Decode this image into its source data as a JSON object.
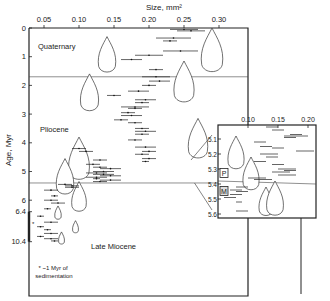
{
  "chart_data": {
    "type": "scatter",
    "title": "",
    "xlabel": "Size, mm²",
    "ylabel": "Age, Myr",
    "x_ticks": [
      "0.05",
      "0.10",
      "0.15",
      "0.20",
      "0.25",
      "0.30"
    ],
    "x_tick_values": [
      0.05,
      0.1,
      0.15,
      0.2,
      0.25,
      0.3
    ],
    "y_ticks": [
      "0",
      "1",
      "2",
      "3",
      "4",
      "5",
      "6",
      "6.4",
      "10.4"
    ],
    "y_tick_values": [
      0,
      1,
      2,
      3,
      4,
      5,
      6,
      6.4,
      10.4
    ],
    "xlim": [
      0.02,
      0.33
    ],
    "ylim": [
      0,
      11.0
    ],
    "epochs": [
      {
        "name": "Quaternary",
        "boundary_myr": 1.7
      },
      {
        "name": "Pliocene",
        "boundary_myr": 5.4
      },
      {
        "name": "Late Miocene",
        "boundary_myr": null
      }
    ],
    "footnote": "* ~1 Myr of sedimentation",
    "series": [
      {
        "name": "size ranges",
        "points": [
          {
            "age": 0.05,
            "x0": 0.23,
            "x1": 0.27
          },
          {
            "age": 0.1,
            "x0": 0.24,
            "x1": 0.28
          },
          {
            "age": 0.35,
            "x0": 0.21,
            "x1": 0.26
          },
          {
            "age": 0.45,
            "x0": 0.22,
            "x1": 0.24
          },
          {
            "age": 0.8,
            "x0": 0.22,
            "x1": 0.27
          },
          {
            "age": 1.1,
            "x0": 0.16,
            "x1": 0.19
          },
          {
            "age": 0.95,
            "x0": 0.18,
            "x1": 0.22
          },
          {
            "age": 1.45,
            "x0": 0.2,
            "x1": 0.22
          },
          {
            "age": 1.7,
            "x0": 0.19,
            "x1": 0.23
          },
          {
            "age": 1.85,
            "x0": 0.2,
            "x1": 0.23
          },
          {
            "age": 2.0,
            "x0": 0.19,
            "x1": 0.21
          },
          {
            "age": 2.2,
            "x0": 0.17,
            "x1": 0.2
          },
          {
            "age": 2.35,
            "x0": 0.14,
            "x1": 0.16
          },
          {
            "age": 2.5,
            "x0": 0.18,
            "x1": 0.21
          },
          {
            "age": 2.6,
            "x0": 0.18,
            "x1": 0.2
          },
          {
            "age": 2.75,
            "x0": 0.16,
            "x1": 0.2
          },
          {
            "age": 2.8,
            "x0": 0.17,
            "x1": 0.19
          },
          {
            "age": 2.95,
            "x0": 0.16,
            "x1": 0.18
          },
          {
            "age": 3.05,
            "x0": 0.16,
            "x1": 0.19
          },
          {
            "age": 3.2,
            "x0": 0.15,
            "x1": 0.17
          },
          {
            "age": 3.3,
            "x0": 0.17,
            "x1": 0.19
          },
          {
            "age": 3.5,
            "x0": 0.18,
            "x1": 0.2
          },
          {
            "age": 3.6,
            "x0": 0.18,
            "x1": 0.21
          },
          {
            "age": 3.7,
            "x0": 0.18,
            "x1": 0.2
          },
          {
            "age": 3.9,
            "x0": 0.17,
            "x1": 0.19
          },
          {
            "age": 4.15,
            "x0": 0.18,
            "x1": 0.21
          },
          {
            "age": 4.3,
            "x0": 0.19,
            "x1": 0.21
          },
          {
            "age": 4.4,
            "x0": 0.18,
            "x1": 0.2
          },
          {
            "age": 4.55,
            "x0": 0.19,
            "x1": 0.21
          },
          {
            "age": 4.65,
            "x0": 0.19,
            "x1": 0.2
          },
          {
            "age": 4.2,
            "x0": 0.09,
            "x1": 0.11
          },
          {
            "age": 4.3,
            "x0": 0.1,
            "x1": 0.12
          },
          {
            "age": 4.6,
            "x0": 0.12,
            "x1": 0.14
          },
          {
            "age": 4.75,
            "x0": 0.11,
            "x1": 0.13
          },
          {
            "age": 4.85,
            "x0": 0.12,
            "x1": 0.14
          },
          {
            "age": 4.9,
            "x0": 0.13,
            "x1": 0.16
          },
          {
            "age": 5.0,
            "x0": 0.12,
            "x1": 0.15
          },
          {
            "age": 5.05,
            "x0": 0.11,
            "x1": 0.14
          },
          {
            "age": 5.1,
            "x0": 0.12,
            "x1": 0.15
          },
          {
            "age": 5.15,
            "x0": 0.13,
            "x1": 0.16
          },
          {
            "age": 5.2,
            "x0": 0.11,
            "x1": 0.14
          },
          {
            "age": 5.25,
            "x0": 0.12,
            "x1": 0.13
          },
          {
            "age": 5.3,
            "x0": 0.13,
            "x1": 0.16
          },
          {
            "age": 5.35,
            "x0": 0.12,
            "x1": 0.14
          },
          {
            "age": 5.45,
            "x0": 0.07,
            "x1": 0.09
          },
          {
            "age": 5.5,
            "x0": 0.08,
            "x1": 0.1
          },
          {
            "age": 5.55,
            "x0": 0.08,
            "x1": 0.1
          },
          {
            "age": 5.65,
            "x0": 0.05,
            "x1": 0.07
          },
          {
            "age": 5.85,
            "x0": 0.06,
            "x1": 0.07
          },
          {
            "age": 6.0,
            "x0": 0.05,
            "x1": 0.07
          },
          {
            "age": 6.1,
            "x0": 0.06,
            "x1": 0.08
          },
          {
            "age": 6.3,
            "x0": 0.05,
            "x1": 0.06
          },
          {
            "age": 7.0,
            "x0": 0.04,
            "x1": 0.05
          },
          {
            "age": 7.8,
            "x0": 0.05,
            "x1": 0.07
          },
          {
            "age": 8.4,
            "x0": 0.04,
            "x1": 0.05
          },
          {
            "age": 8.8,
            "x0": 0.05,
            "x1": 0.06
          },
          {
            "age": 9.3,
            "x0": 0.05,
            "x1": 0.07
          },
          {
            "age": 9.7,
            "x0": 0.04,
            "x1": 0.05
          },
          {
            "age": 10.0,
            "x0": 0.05,
            "x1": 0.07
          },
          {
            "age": 10.3,
            "x0": 0.06,
            "x1": 0.07
          }
        ]
      }
    ],
    "inset": {
      "x_ticks": [
        "0.10",
        "0.15",
        "0.20"
      ],
      "x_tick_values": [
        0.1,
        0.15,
        0.2
      ],
      "y_ticks": [
        "5.1",
        "5.2",
        "5.3",
        "5.4",
        "5.5",
        "5.6"
      ],
      "y_tick_values": [
        5.1,
        5.2,
        5.3,
        5.4,
        5.5,
        5.6
      ],
      "xlim": [
        0.05,
        0.215
      ],
      "ylim": [
        5.01,
        5.63
      ],
      "boundary_myr": 5.38,
      "labels": [
        "P",
        "M"
      ],
      "points": [
        {
          "age": 5.02,
          "x0": 0.13,
          "x1": 0.15
        },
        {
          "age": 5.04,
          "x0": 0.14,
          "x1": 0.16
        },
        {
          "age": 5.07,
          "x0": 0.17,
          "x1": 0.19
        },
        {
          "age": 5.08,
          "x0": 0.16,
          "x1": 0.2
        },
        {
          "age": 5.09,
          "x0": 0.16,
          "x1": 0.18
        },
        {
          "age": 5.12,
          "x0": 0.11,
          "x1": 0.13
        },
        {
          "age": 5.15,
          "x0": 0.12,
          "x1": 0.14
        },
        {
          "age": 5.16,
          "x0": 0.14,
          "x1": 0.16
        },
        {
          "age": 5.18,
          "x0": 0.18,
          "x1": 0.21
        },
        {
          "age": 5.2,
          "x0": 0.12,
          "x1": 0.15
        },
        {
          "age": 5.22,
          "x0": 0.13,
          "x1": 0.15
        },
        {
          "age": 5.25,
          "x0": 0.11,
          "x1": 0.13
        },
        {
          "age": 5.27,
          "x0": 0.14,
          "x1": 0.16
        },
        {
          "age": 5.3,
          "x0": 0.15,
          "x1": 0.18
        },
        {
          "age": 5.31,
          "x0": 0.16,
          "x1": 0.18
        },
        {
          "age": 5.32,
          "x0": 0.14,
          "x1": 0.17
        },
        {
          "age": 5.34,
          "x0": 0.15,
          "x1": 0.18
        },
        {
          "age": 5.36,
          "x0": 0.1,
          "x1": 0.13
        },
        {
          "age": 5.37,
          "x0": 0.11,
          "x1": 0.14
        },
        {
          "age": 5.42,
          "x0": 0.08,
          "x1": 0.1
        },
        {
          "age": 5.44,
          "x0": 0.07,
          "x1": 0.09
        },
        {
          "age": 5.45,
          "x0": 0.08,
          "x1": 0.1
        },
        {
          "age": 5.47,
          "x0": 0.07,
          "x1": 0.09
        },
        {
          "age": 5.49,
          "x0": 0.06,
          "x1": 0.08
        },
        {
          "age": 5.52,
          "x0": 0.08,
          "x1": 0.09
        },
        {
          "age": 5.58,
          "x0": 0.08,
          "x1": 0.1
        }
      ]
    },
    "shells": {
      "main": [
        {
          "x": 0.14,
          "age_top": 0.3,
          "age_bot": 1.6
        },
        {
          "x": 0.29,
          "age_top": 0.0,
          "age_bot": 1.6
        },
        {
          "x": 0.115,
          "age_top": 1.6,
          "age_bot": 2.95
        },
        {
          "x": 0.25,
          "age_top": 1.15,
          "age_bot": 2.65
        },
        {
          "x": 0.27,
          "age_top": 3.15,
          "age_bot": 4.6
        },
        {
          "x": 0.1,
          "age_top": 3.8,
          "age_bot": 5.35
        },
        {
          "x": 0.08,
          "age_top": 4.55,
          "age_bot": 5.85
        },
        {
          "x": 0.1,
          "age_top": 5.35,
          "age_bot": 6.55
        },
        {
          "x": 0.07,
          "age_top": 6.2,
          "age_bot": 7.5
        },
        {
          "x": 0.095,
          "age_top": 7.6,
          "age_bot": 9.3
        },
        {
          "x": 0.075,
          "age_top": 9.1,
          "age_bot": 10.8
        }
      ],
      "inset": [
        {
          "x": 0.08,
          "age_top": 5.08,
          "age_bot": 5.31
        },
        {
          "x": 0.105,
          "age_top": 5.22,
          "age_bot": 5.45
        },
        {
          "x": 0.13,
          "age_top": 5.42,
          "age_bot": 5.62
        },
        {
          "x": 0.145,
          "age_top": 5.38,
          "age_bot": 5.62
        }
      ]
    }
  }
}
